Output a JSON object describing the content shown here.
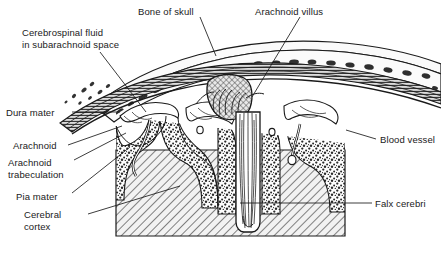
{
  "figure": {
    "background_color": "#ffffff",
    "ink_color": "#1a1a1a"
  },
  "labels": [
    {
      "id": "csf",
      "text": "Cerebrospinal fluid\nin subarachnoid space",
      "x": 22,
      "y": 27,
      "side": "left"
    },
    {
      "id": "bone",
      "text": "Bone of skull",
      "x": 138,
      "y": 6,
      "side": "left"
    },
    {
      "id": "villus",
      "text": "Arachnoid villus",
      "x": 255,
      "y": 6,
      "side": "left"
    },
    {
      "id": "dura",
      "text": "Dura mater",
      "x": 6,
      "y": 107,
      "side": "left"
    },
    {
      "id": "arachnoid",
      "text": "Arachnoid",
      "x": 13,
      "y": 140,
      "side": "left"
    },
    {
      "id": "trabeculation",
      "text": "Arachnoid\ntrabeculation",
      "x": 8,
      "y": 157,
      "side": "left"
    },
    {
      "id": "pia",
      "text": "Pia mater",
      "x": 16,
      "y": 191,
      "side": "left"
    },
    {
      "id": "cortex",
      "text": "Cerebral\ncortex",
      "x": 24,
      "y": 209,
      "side": "left"
    },
    {
      "id": "vessel",
      "text": "Blood vessel",
      "x": 380,
      "y": 134,
      "side": "right"
    },
    {
      "id": "falx",
      "text": "Falx cerebri",
      "x": 375,
      "y": 198,
      "side": "right"
    }
  ],
  "structures": [
    {
      "id": "skull-bone",
      "name": "Bone of skull",
      "texture": "diploe-trabecular"
    },
    {
      "id": "dura-mater",
      "name": "Dura mater",
      "texture": "dense-fibrous-lines"
    },
    {
      "id": "subarachnoid-space",
      "name": "Subarachnoid space (CSF)",
      "texture": "white"
    },
    {
      "id": "arachnoid-membrane",
      "name": "Arachnoid",
      "texture": "thin-line"
    },
    {
      "id": "arachnoid-trabeculae",
      "name": "Arachnoid trabeculation",
      "texture": "fine-strands"
    },
    {
      "id": "arachnoid-villus",
      "name": "Arachnoid villus",
      "texture": "strand-bundle"
    },
    {
      "id": "superior-sagittal-sinus",
      "name": "Superior sagittal sinus",
      "texture": "cross-hatch"
    },
    {
      "id": "pia-mater",
      "name": "Pia mater",
      "texture": "thin-line"
    },
    {
      "id": "cerebral-cortex",
      "name": "Cerebral cortex (grey matter)",
      "texture": "stipple"
    },
    {
      "id": "white-matter",
      "name": "White matter",
      "texture": "diagonal-hatch"
    },
    {
      "id": "falx-cerebri",
      "name": "Falx cerebri",
      "texture": "double-line"
    },
    {
      "id": "blood-vessel",
      "name": "Blood vessel",
      "texture": "outline"
    }
  ]
}
